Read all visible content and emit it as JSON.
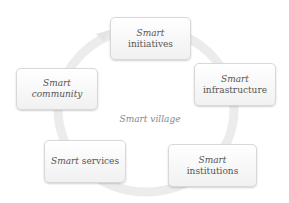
{
  "diagram": {
    "center_label": "Smart village",
    "nodes": [
      {
        "id": "initiatives",
        "prefix": "Smart",
        "suffix": " initiatives",
        "line2": ""
      },
      {
        "id": "infrastructure",
        "prefix": "Smart",
        "suffix": "",
        "line2": "infrastructure"
      },
      {
        "id": "institutions",
        "prefix": "Smart",
        "suffix": " institutions",
        "line2": ""
      },
      {
        "id": "services",
        "prefix": "Smart",
        "suffix": " services",
        "line2": ""
      },
      {
        "id": "community",
        "prefix": "Smart",
        "suffix": " community",
        "line2": ""
      }
    ],
    "colors": {
      "ring": "#e6e6e6",
      "box_border": "#d8d8d8",
      "text": "#555555"
    }
  }
}
